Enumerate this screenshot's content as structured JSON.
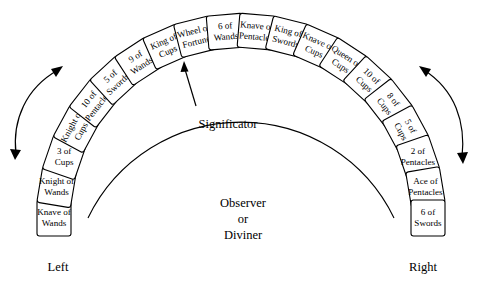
{
  "diagram": {
    "center_label": {
      "line1": "Observer",
      "line2": "or",
      "line3": "Diviner"
    },
    "significator_label": "Significator",
    "left_label": "Left",
    "right_label": "Right",
    "colors": {
      "background": "#ffffff",
      "stroke": "#000000",
      "card_fill": "#ffffff",
      "text": "#000000"
    },
    "cards": [
      {
        "index": 1,
        "name": "Knave of Wands",
        "line1": "Knave of",
        "line2": "Wands"
      },
      {
        "index": 2,
        "name": "Knight of Wands",
        "line1": "Knight of",
        "line2": "Wands"
      },
      {
        "index": 3,
        "name": "3 of Cups",
        "line1": "3 of",
        "line2": "Cups"
      },
      {
        "index": 4,
        "name": "Knight of Cups",
        "line1": "Knight of",
        "line2": "Cups"
      },
      {
        "index": 5,
        "name": "10 of Pentacles",
        "line1": "10 of",
        "line2": "Pentacles"
      },
      {
        "index": 6,
        "name": "5 of Swords",
        "line1": "5 of",
        "line2": "Swords"
      },
      {
        "index": 7,
        "name": "9 of Wands",
        "line1": "9 of",
        "line2": "Wands"
      },
      {
        "index": 8,
        "name": "King of Cups",
        "line1": "King of",
        "line2": "Cups"
      },
      {
        "index": 9,
        "name": "Wheel of Fortune",
        "line1": "Wheel of",
        "line2": "Fortune"
      },
      {
        "index": 10,
        "name": "6 of Wands",
        "line1": "6 of",
        "line2": "Wands"
      },
      {
        "index": 11,
        "name": "Knave of Pentacles",
        "line1": "Knave of",
        "line2": "Pentacles"
      },
      {
        "index": 12,
        "name": "King of Swords",
        "line1": "King of",
        "line2": "Swords"
      },
      {
        "index": 13,
        "name": "Knave of Cups",
        "line1": "Knave of",
        "line2": "Cups"
      },
      {
        "index": 14,
        "name": "Queen of Cups",
        "line1": "Queen of",
        "line2": "Cups"
      },
      {
        "index": 15,
        "name": "10 of Cups",
        "line1": "10 of",
        "line2": "Cups"
      },
      {
        "index": 16,
        "name": "8 of Cups",
        "line1": "8 of",
        "line2": "Cups"
      },
      {
        "index": 17,
        "name": "5 of Cups",
        "line1": "5 of",
        "line2": "Cups"
      },
      {
        "index": 18,
        "name": "2 of Pentacles",
        "line1": "2 of",
        "line2": "Pentacles"
      },
      {
        "index": 19,
        "name": "Ace of Pentacles",
        "line1": "Ace of",
        "line2": "Pentacles"
      },
      {
        "index": 20,
        "name": "6 of Swords",
        "line1": "6 of",
        "line2": "Swords"
      }
    ]
  }
}
